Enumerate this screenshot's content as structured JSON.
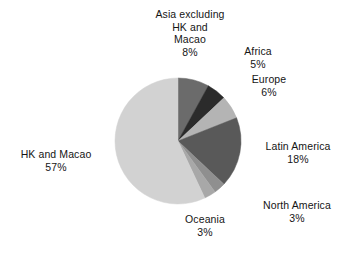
{
  "chart_data": {
    "type": "pie",
    "title": "",
    "subtitle": "",
    "xlabel": "",
    "ylabel": "",
    "legend_position": "none",
    "grid": false,
    "value_unit": "percent",
    "start_angle_deg": 0,
    "direction": "clockwise",
    "categories": [
      "Asia excluding HK and Macao",
      "Africa",
      "Europe",
      "Latin America",
      "North America",
      "Oceania",
      "HK and Macao"
    ],
    "values": [
      8,
      5,
      6,
      18,
      3,
      3,
      57
    ],
    "colors": [
      "#6b6b6b",
      "#2b2b2b",
      "#b4b4b4",
      "#595959",
      "#8f8f8f",
      "#a8a8a8",
      "#d2d2d2"
    ],
    "slices": [
      {
        "label": "Asia excluding HK and Macao",
        "value": 8,
        "percent_text": "8%",
        "color": "#6b6b6b"
      },
      {
        "label": "Africa",
        "value": 5,
        "percent_text": "5%",
        "color": "#2b2b2b"
      },
      {
        "label": "Europe",
        "value": 6,
        "percent_text": "6%",
        "color": "#b4b4b4"
      },
      {
        "label": "Latin America",
        "value": 18,
        "percent_text": "18%",
        "color": "#595959"
      },
      {
        "label": "North America",
        "value": 3,
        "percent_text": "3%",
        "color": "#8f8f8f"
      },
      {
        "label": "Oceania",
        "value": 3,
        "percent_text": "3%",
        "color": "#a8a8a8"
      },
      {
        "label": "HK and Macao",
        "value": 57,
        "percent_text": "57%",
        "color": "#d2d2d2"
      }
    ]
  },
  "labels": {
    "asia": {
      "line1": "Asia excluding",
      "line2": "HK and",
      "line3": "Macao",
      "pct": "8%"
    },
    "africa": {
      "name": "Africa",
      "pct": "5%"
    },
    "europe": {
      "name": "Europe",
      "pct": "6%"
    },
    "latin": {
      "name": "Latin America",
      "pct": "18%"
    },
    "north": {
      "name": "North America",
      "pct": "3%"
    },
    "oceania": {
      "name": "Oceania",
      "pct": "3%"
    },
    "hk": {
      "name": "HK and Macao",
      "pct": "57%"
    }
  },
  "figure": {
    "background": "#ffffff",
    "center_x": 178,
    "center_y": 141,
    "radius": 63
  }
}
